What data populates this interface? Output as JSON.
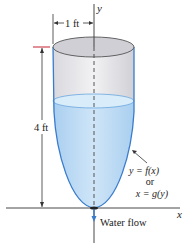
{
  "diagram": {
    "type": "tank-cross-section",
    "labels": {
      "width_dim": "1 ft",
      "height_dim": "4 ft",
      "y_axis": "y",
      "x_axis": "x",
      "curve_line1": "y = f(x)",
      "curve_line2": "or",
      "curve_line3": "x = g(y)",
      "flow": "Water flow"
    },
    "colors": {
      "water": "#bfdcf5",
      "water_surface": "#d6e9f8",
      "tank_outline": "#3a7ccc",
      "tank_interior": "#e6e6ea",
      "rim_top": "#c9c9cf",
      "marker_red": "#cc3344",
      "axis": "#333333"
    }
  }
}
